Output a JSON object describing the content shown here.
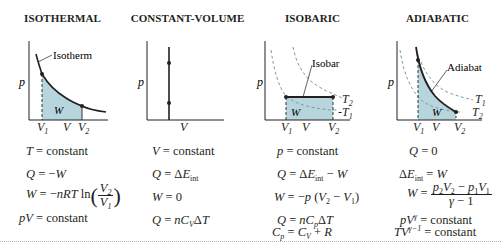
{
  "panels": [
    {
      "title": "ISOTHERMAL",
      "curve_label": "Isotherm",
      "axis_y": "p",
      "area_label": "W",
      "x_ticks": [
        "V1",
        "V",
        "V2"
      ],
      "equations": [
        "T = constant",
        "Q = −W",
        "W = −nRT ln(V2/V1)",
        "pV = constant"
      ]
    },
    {
      "title": "CONSTANT-VOLUME",
      "axis_y": "p",
      "x_ticks": [
        "V"
      ],
      "equations": [
        "V = constant",
        "Q = ΔEint",
        "W = 0",
        "Q = nCVΔT"
      ]
    },
    {
      "title": "ISOBARIC",
      "curve_label": "Isobar",
      "axis_y": "p",
      "area_label": "W",
      "isotherm_labels": [
        "T2",
        "T1"
      ],
      "x_ticks": [
        "V1",
        "V",
        "V2"
      ],
      "equations": [
        "p = constant",
        "Q = ΔEint − W",
        "W = −p (V2 − V1)",
        "Q = nCpΔT",
        "Cp = CV + R"
      ]
    },
    {
      "title": "ADIABATIC",
      "curve_label": "Adiabat",
      "axis_y": "p",
      "area_label": "W",
      "isotherm_labels": [
        "T1",
        "T2"
      ],
      "x_ticks": [
        "V1",
        "V",
        "V2"
      ],
      "equations": [
        "Q = 0",
        "ΔEint = W",
        "W = (p2V2 − p1V1)/(γ − 1)",
        "pV^γ = constant",
        "TV^(γ−1) = constant"
      ]
    }
  ],
  "colors": {
    "fill": "#b7d5dc",
    "curve": "#231f20",
    "dashed": "#7a9ea6",
    "rule": "#b0b4b8"
  }
}
